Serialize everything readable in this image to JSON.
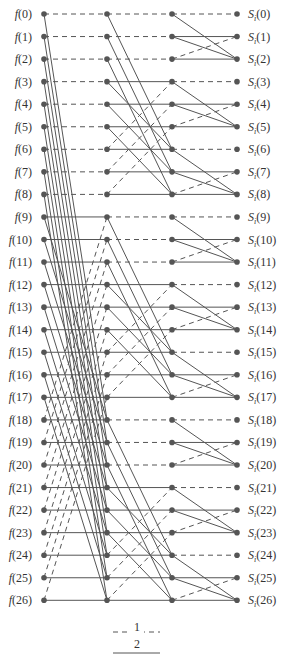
{
  "diagram": {
    "type": "radix-3 FFT butterfly (signal flow graph)",
    "num_points": 27,
    "input_prefix": "f",
    "output_prefix": "S",
    "output_subscript": "i",
    "inputs": [
      "f(0)",
      "f(1)",
      "f(2)",
      "f(3)",
      "f(4)",
      "f(5)",
      "f(6)",
      "f(7)",
      "f(8)",
      "f(9)",
      "f(10)",
      "f(11)",
      "f(12)",
      "f(13)",
      "f(14)",
      "f(15)",
      "f(16)",
      "f(17)",
      "f(18)",
      "f(19)",
      "f(20)",
      "f(21)",
      "f(22)",
      "f(23)",
      "f(24)",
      "f(25)",
      "f(26)"
    ],
    "outputs": [
      "0",
      "1",
      "2",
      "3",
      "4",
      "5",
      "6",
      "7",
      "8",
      "9",
      "10",
      "11",
      "12",
      "13",
      "14",
      "15",
      "16",
      "17",
      "18",
      "19",
      "20",
      "21",
      "22",
      "23",
      "24",
      "25",
      "26"
    ],
    "stages": [
      {
        "name": "stage-1",
        "block_size": 9
      },
      {
        "name": "stage-2",
        "block_size": 3
      },
      {
        "name": "stage-3",
        "block_size": 1
      }
    ],
    "edge_rule": "within each triple of blocks (A,B,C): A->A dashed, A->C solid, B->B solid, B->C solid, C->B dashed, C->C solid",
    "colors": {
      "line": "#555555",
      "node": "#555555",
      "text": "#333333"
    }
  },
  "legend": {
    "items": [
      {
        "style": "dashed",
        "label": "1"
      },
      {
        "style": "solid",
        "label": "2"
      }
    ]
  }
}
